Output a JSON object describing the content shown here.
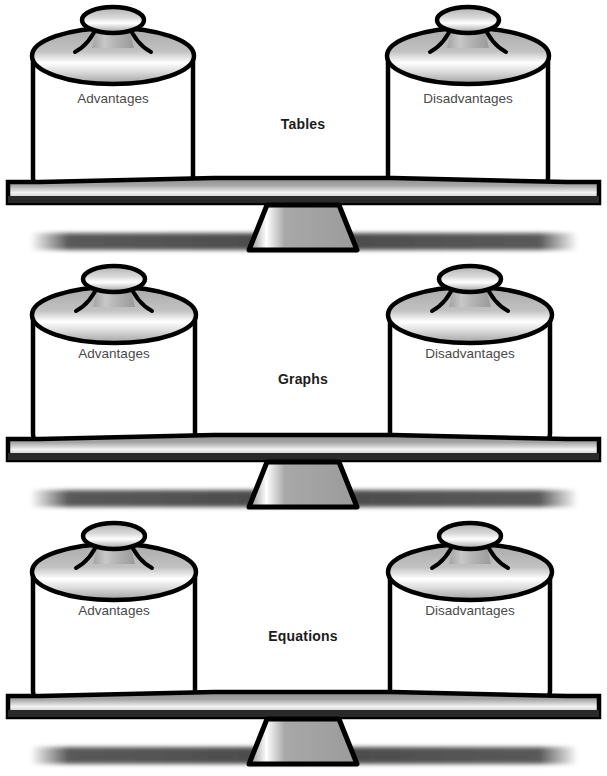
{
  "figure": {
    "background_color": "#ffffff",
    "outline_color": "#000000",
    "label_color": "#4a4a4a",
    "center_label_color": "#1c1c1c",
    "metal_light": "#ffffff",
    "metal_mid": "#b5b5b5",
    "metal_dark": "#8f8f8f",
    "shadow_color": "#4d4d4d"
  },
  "scales": [
    {
      "center_label": "Tables",
      "left_jar_label": "Advantages",
      "right_jar_label": "Disadvantages",
      "state": "balanced"
    },
    {
      "center_label": "Graphs",
      "left_jar_label": "Advantages",
      "right_jar_label": "Disadvantages",
      "state": "balanced"
    },
    {
      "center_label": "Equations",
      "left_jar_label": "Advantages",
      "right_jar_label": "Disadvantages",
      "state": "balanced"
    }
  ]
}
